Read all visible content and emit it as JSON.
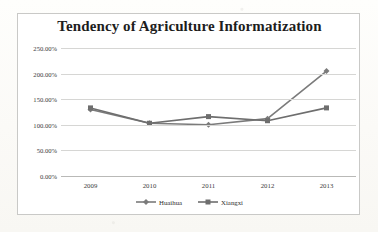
{
  "chart_data": {
    "type": "line",
    "title": "Tendency of Agriculture Informatization",
    "xlabel": "",
    "ylabel": "",
    "categories": [
      "2009",
      "2010",
      "2011",
      "2012",
      "2013"
    ],
    "ylim": [
      0,
      250
    ],
    "yticks": [
      "0.00%",
      "50.00%",
      "100.00%",
      "150.00%",
      "200.00%",
      "250.00%"
    ],
    "ytick_values": [
      0,
      50,
      100,
      150,
      200,
      250
    ],
    "grid": "horizontal",
    "legend_position": "bottom",
    "series": [
      {
        "name": "Huaihua",
        "marker": "diamond",
        "color": "#7b7b7b",
        "values": [
          130,
          103,
          100,
          112,
          205
        ]
      },
      {
        "name": "Xiangxi",
        "marker": "square",
        "color": "#6e6e6e",
        "values": [
          133,
          103,
          116,
          108,
          133
        ]
      }
    ]
  },
  "frame": {
    "border_color": "#c9c9c7",
    "background": "#ffffff"
  }
}
